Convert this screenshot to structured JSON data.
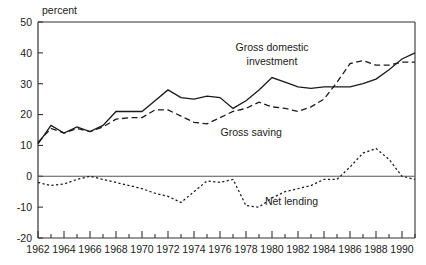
{
  "figure": {
    "ylabel": "percent",
    "title_fragment": ""
  },
  "chart_data": {
    "type": "line",
    "title": "",
    "xlabel": "",
    "ylabel": "percent",
    "xlim": [
      1962,
      1991
    ],
    "ylim": [
      -20,
      50
    ],
    "yticks": [
      -20,
      -10,
      0,
      10,
      20,
      30,
      40,
      50
    ],
    "ytick_labels": [
      "-20",
      "-10",
      "0",
      "10",
      "20",
      "30",
      "40",
      "50"
    ],
    "xticks": [
      1962,
      1963,
      1964,
      1965,
      1966,
      1967,
      1968,
      1969,
      1970,
      1971,
      1972,
      1973,
      1974,
      1975,
      1976,
      1977,
      1978,
      1979,
      1980,
      1981,
      1982,
      1983,
      1984,
      1985,
      1986,
      1987,
      1988,
      1989,
      1990,
      1991
    ],
    "xtick_labels_shown": [
      "1962",
      "1964",
      "1966",
      "1968",
      "1970",
      "1972",
      "1974",
      "1976",
      "1978",
      "1980",
      "1982",
      "1984",
      "1986",
      "1988",
      "1990"
    ],
    "grid": false,
    "legend_position": "inline-annotations",
    "x": [
      1962,
      1963,
      1964,
      1965,
      1966,
      1967,
      1968,
      1969,
      1970,
      1971,
      1972,
      1973,
      1974,
      1975,
      1976,
      1977,
      1978,
      1979,
      1980,
      1981,
      1982,
      1983,
      1984,
      1985,
      1986,
      1987,
      1988,
      1989,
      1990,
      1991
    ],
    "series": [
      {
        "name": "Gross domestic investment",
        "style": "solid",
        "values": [
          10.5,
          16.5,
          14.0,
          16.0,
          14.5,
          16.5,
          21.0,
          21.0,
          21.0,
          24.5,
          28.0,
          25.5,
          25.0,
          26.0,
          25.5,
          22.0,
          24.5,
          28.0,
          32.0,
          30.5,
          29.0,
          28.5,
          29.0,
          29.0,
          29.0,
          30.0,
          31.5,
          34.5,
          38.0,
          40.0
        ]
      },
      {
        "name": "Gross saving",
        "style": "dashed",
        "values": [
          11.0,
          15.5,
          14.0,
          15.5,
          14.5,
          16.0,
          18.5,
          19.0,
          19.0,
          21.5,
          21.5,
          19.5,
          17.5,
          17.0,
          19.0,
          21.0,
          22.0,
          24.0,
          22.5,
          22.0,
          21.0,
          22.5,
          25.0,
          30.5,
          36.5,
          37.5,
          36.0,
          36.0,
          37.0,
          37.0
        ]
      },
      {
        "name": "Net lending",
        "style": "dotted",
        "values": [
          -2.0,
          -3.0,
          -2.5,
          -1.0,
          0.0,
          -1.0,
          -2.0,
          -3.0,
          -4.0,
          -5.5,
          -6.5,
          -8.5,
          -5.0,
          -1.5,
          -2.0,
          -1.0,
          -9.5,
          -10.0,
          -7.0,
          -5.0,
          -4.0,
          -3.0,
          -1.0,
          -1.0,
          3.0,
          7.5,
          9.0,
          5.5,
          0.0,
          -1.0
        ]
      }
    ],
    "annotations": [
      {
        "text": "Gross domestic",
        "x": 1980.0,
        "y": 40.5,
        "name": "label-gross-domestic-investment-line1"
      },
      {
        "text": "investment",
        "x": 1980.0,
        "y": 36.0,
        "name": "label-gross-domestic-investment-line2"
      },
      {
        "text": "Gross saving",
        "x": 1978.4,
        "y": 13.0,
        "name": "label-gross-saving"
      },
      {
        "text": "Net lending",
        "x": 1981.5,
        "y": -9.3,
        "name": "label-net-lending"
      }
    ]
  }
}
